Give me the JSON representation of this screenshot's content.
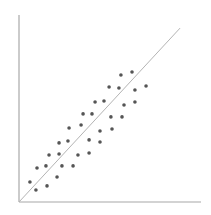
{
  "chart_data": {
    "type": "scatter",
    "title": "",
    "xlabel": "",
    "ylabel": "",
    "xlim": [
      0,
      100
    ],
    "ylim": [
      0,
      100
    ],
    "grid": false,
    "legend": null,
    "tick_labels": false,
    "points": [
      [
        6.0,
        10.7
      ],
      [
        9.3,
        6.4
      ],
      [
        9.9,
        18.2
      ],
      [
        14.8,
        19.3
      ],
      [
        15.4,
        8.6
      ],
      [
        16.5,
        25.1
      ],
      [
        20.9,
        13.4
      ],
      [
        22.0,
        25.7
      ],
      [
        23.6,
        19.3
      ],
      [
        22.0,
        31.6
      ],
      [
        26.9,
        32.6
      ],
      [
        27.5,
        39.6
      ],
      [
        29.7,
        19.3
      ],
      [
        32.4,
        25.1
      ],
      [
        34.1,
        41.2
      ],
      [
        35.2,
        47.1
      ],
      [
        38.5,
        26.2
      ],
      [
        38.5,
        33.2
      ],
      [
        40.1,
        47.1
      ],
      [
        41.8,
        53.5
      ],
      [
        44.5,
        38.0
      ],
      [
        44.5,
        32.1
      ],
      [
        46.7,
        54.0
      ],
      [
        49.5,
        61.5
      ],
      [
        50.5,
        45.5
      ],
      [
        51.1,
        39.0
      ],
      [
        54.9,
        61.0
      ],
      [
        56.0,
        67.9
      ],
      [
        56.6,
        45.5
      ],
      [
        57.7,
        51.9
      ],
      [
        62.1,
        69.5
      ],
      [
        63.7,
        59.9
      ],
      [
        63.7,
        53.5
      ],
      [
        69.8,
        62.0
      ]
    ],
    "trend_line": {
      "from": [
        0,
        0
      ],
      "to": [
        88.5,
        93.0
      ]
    },
    "colors": {
      "points": "#555555",
      "axes": "#a8a8a8",
      "trend_line": "#b4b4b4"
    }
  }
}
